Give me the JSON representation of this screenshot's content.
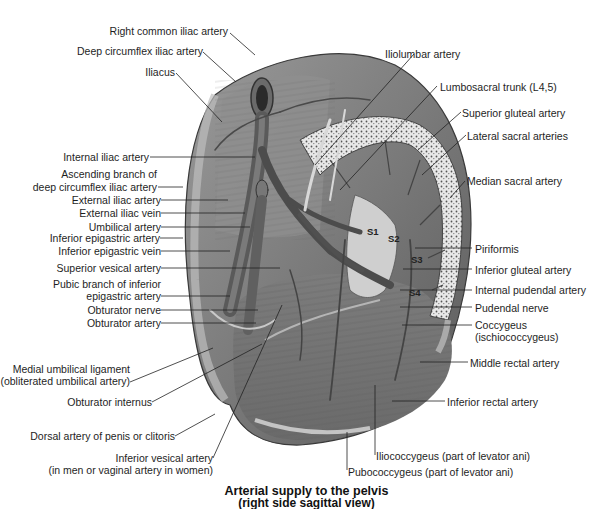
{
  "figure": {
    "title_line1": "Arterial supply to the pelvis",
    "title_line2": "(right side sagittal view)",
    "colors": {
      "background": "#ffffff",
      "muscle": "#8a8a8a",
      "muscle_dark": "#5e5e5e",
      "vessel": "#4a4a4a",
      "bone": "#e6e6e6",
      "leader_line": "#222222"
    }
  },
  "labels_left": [
    {
      "id": "right-common-iliac-artery",
      "text": "Right common iliac artery"
    },
    {
      "id": "deep-circumflex-iliac-artery",
      "text": "Deep circumflex iliac artery"
    },
    {
      "id": "iliacus",
      "text": "Iliacus"
    },
    {
      "id": "internal-iliac-artery",
      "text": "Internal iliac artery"
    },
    {
      "id": "ascending-branch-1",
      "text": "Ascending branch of"
    },
    {
      "id": "ascending-branch-2",
      "text": "deep circumflex iliac artery"
    },
    {
      "id": "external-iliac-artery",
      "text": "External iliac artery"
    },
    {
      "id": "external-iliac-vein",
      "text": "External iliac vein"
    },
    {
      "id": "umbilical-artery",
      "text": "Umbilical artery"
    },
    {
      "id": "inferior-epigastric-artery",
      "text": "Inferior epigastric artery"
    },
    {
      "id": "inferior-epigastric-vein",
      "text": "Inferior epigastric vein"
    },
    {
      "id": "superior-vesical-artery",
      "text": "Superior vesical artery"
    },
    {
      "id": "pubic-branch-1",
      "text": "Pubic branch of inferior"
    },
    {
      "id": "pubic-branch-2",
      "text": "epigastric artery"
    },
    {
      "id": "obturator-nerve",
      "text": "Obturator nerve"
    },
    {
      "id": "obturator-artery",
      "text": "Obturator artery"
    },
    {
      "id": "medial-umbilical-1",
      "text": "Medial umbilical ligament"
    },
    {
      "id": "medial-umbilical-2",
      "text": "(obliterated umbilical artery)"
    },
    {
      "id": "obturator-internus",
      "text": "Obturator internus"
    },
    {
      "id": "dorsal-artery",
      "text": "Dorsal artery of  penis or clitoris"
    },
    {
      "id": "inferior-vesical-1",
      "text": "Inferior vesical artery"
    },
    {
      "id": "inferior-vesical-2",
      "text": "(in men or vaginal artery in women)"
    }
  ],
  "labels_right": [
    {
      "id": "iliolumbar-artery",
      "text": "Iliolumbar artery"
    },
    {
      "id": "lumbosacral-trunk",
      "text": "Lumbosacral trunk (L4,5)"
    },
    {
      "id": "superior-gluteal-artery",
      "text": "Superior gluteal artery"
    },
    {
      "id": "lateral-sacral-arteries",
      "text": "Lateral sacral arteries"
    },
    {
      "id": "median-sacral-artery",
      "text": "Median sacral artery"
    },
    {
      "id": "piriformis",
      "text": "Piriformis"
    },
    {
      "id": "inferior-gluteal-artery",
      "text": "Inferior gluteal artery"
    },
    {
      "id": "internal-pudendal-artery",
      "text": "Internal pudendal artery"
    },
    {
      "id": "pudendal-nerve",
      "text": "Pudendal nerve"
    },
    {
      "id": "coccygeus-1",
      "text": "Coccygeus"
    },
    {
      "id": "coccygeus-2",
      "text": "(ischiococcygeus)"
    },
    {
      "id": "middle-rectal-artery",
      "text": "Middle rectal artery"
    },
    {
      "id": "inferior-rectal-artery",
      "text": "Inferior rectal artery"
    },
    {
      "id": "iliococcygeus",
      "text": "Iliococcygeus (part of levator ani)"
    },
    {
      "id": "pubococcygeus",
      "text": "Pubococcygeus (part of levator ani)"
    }
  ],
  "sacral_markers": [
    "S1",
    "S2",
    "S3",
    "S4"
  ]
}
